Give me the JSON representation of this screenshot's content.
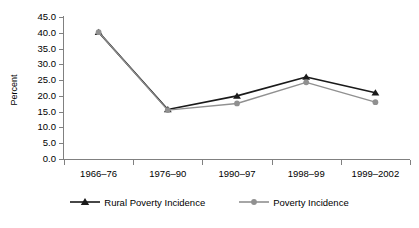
{
  "chart_data": {
    "type": "line",
    "title": "",
    "subtitle": "",
    "xlabel": "",
    "ylabel": "Percent",
    "categories": [
      "1966–76",
      "1976–90",
      "1990–97",
      "1998–99",
      "1999–2002"
    ],
    "series": [
      {
        "name": "Rural Poverty Incidence",
        "color": "#1a1a1a",
        "marker": "triangle",
        "values": [
          40.2,
          15.7,
          20.0,
          26.0,
          21.0
        ]
      },
      {
        "name": "Poverty Incidence",
        "color": "#909090",
        "marker": "circle",
        "values": [
          40.2,
          15.5,
          17.6,
          24.3,
          18.0
        ]
      }
    ],
    "ylim": [
      0.0,
      45.0
    ],
    "ytick_step": 5.0,
    "ytick_labels": [
      "45.0",
      "40.0",
      "35.0",
      "30.0",
      "25.0",
      "20.0",
      "15.0",
      "10.0",
      "5.0",
      "0.0"
    ],
    "grid": false,
    "legend_position": "bottom",
    "axis_color": "#808080"
  }
}
